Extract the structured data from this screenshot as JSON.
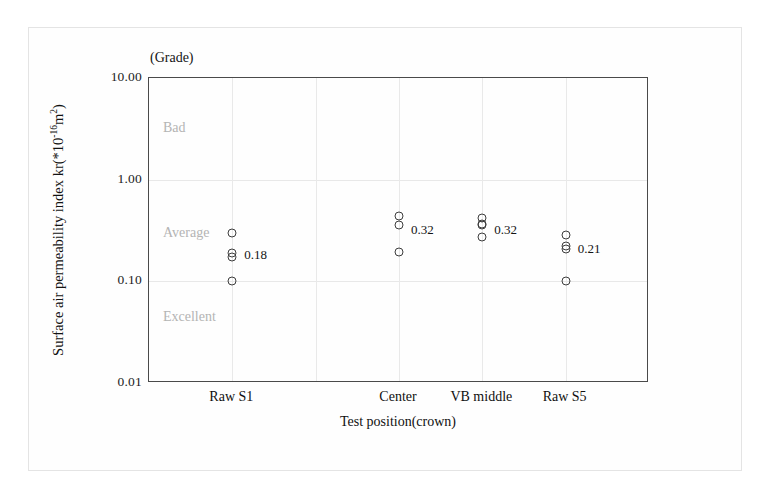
{
  "chart_data": {
    "type": "scatter",
    "title": "",
    "grade_caption": "(Grade)",
    "xlabel": "Test position(crown)",
    "ylabel_text": "Surface air permeability index kr(*10",
    "ylabel_exponent": "-16",
    "ylabel_tail": "m",
    "ylabel_tail_exponent": "2",
    "ylabel_close": ")",
    "yscale": "log",
    "ylim": [
      0.01,
      10.0
    ],
    "ytick_labels": [
      "10.00",
      "1.00",
      "0.10",
      "0.01"
    ],
    "ytick_values": [
      10.0,
      1.0,
      0.1,
      0.01
    ],
    "grid": true,
    "vertical_gridlines": 5,
    "legend": "none",
    "grade_zones": [
      {
        "label": "Bad",
        "value": 3.2
      },
      {
        "label": "Average",
        "value": 0.3
      },
      {
        "label": "Excellent",
        "value": 0.045
      }
    ],
    "categories": [
      "Raw S1",
      "Center",
      "VB middle",
      "Raw S5"
    ],
    "groups": [
      {
        "name": "Raw S1",
        "x_frac": 0.1667,
        "annotation": "0.18",
        "annotation_value": 0.18,
        "values": [
          0.3,
          0.19,
          0.175,
          0.1
        ]
      },
      {
        "name": "Center",
        "x_frac": 0.5,
        "annotation": "0.32",
        "annotation_value": 0.32,
        "values": [
          0.44,
          0.36,
          0.195
        ]
      },
      {
        "name": "VB middle",
        "x_frac": 0.6667,
        "annotation": "0.32",
        "annotation_value": 0.32,
        "values": [
          0.42,
          0.37,
          0.355,
          0.27
        ]
      },
      {
        "name": "Raw S5",
        "x_frac": 0.8333,
        "annotation": "0.21",
        "annotation_value": 0.21,
        "values": [
          0.285,
          0.225,
          0.21,
          0.1
        ]
      }
    ]
  }
}
